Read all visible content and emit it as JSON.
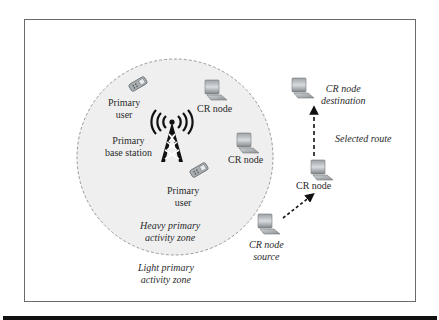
{
  "figure": {
    "zones": {
      "heavy": [
        "Heavy primary",
        "activity zone"
      ],
      "light": [
        "Light primary",
        "activity zone"
      ]
    },
    "primary_user_1": [
      "Primary",
      "user"
    ],
    "primary_user_2": [
      "Primary",
      "user"
    ],
    "base_station": [
      "Primary",
      "base station"
    ],
    "cr_node_1": "CR node",
    "cr_node_2": "CR node",
    "cr_node_relay": "CR node",
    "cr_node_source": [
      "CR node",
      "source"
    ],
    "cr_node_destination": [
      "CR node",
      "destination"
    ],
    "route_label": "Selected route",
    "colors": {
      "frame": "#6a6a6a",
      "zone_fill": "#efefef",
      "zone_border": "#9a9a9a",
      "tower": "#111111",
      "text": "#2b2b2b"
    }
  }
}
